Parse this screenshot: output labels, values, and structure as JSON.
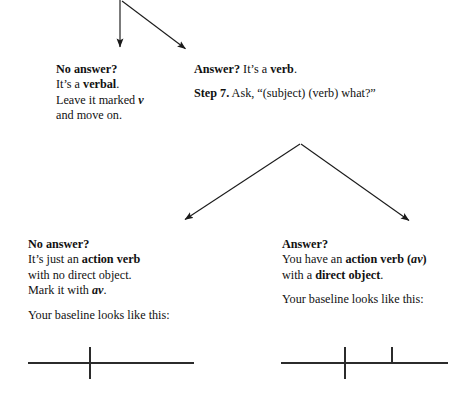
{
  "diagram": {
    "stroke_color": "#1a1a1a",
    "text_color": "#111111",
    "background": "#ffffff",
    "arrows": [
      {
        "name": "arrow-down-to-no-answer-verbal",
        "from": [
          120,
          0
        ],
        "to": [
          120,
          52
        ]
      },
      {
        "name": "arrow-diagonal-to-answer-verb",
        "from": [
          122,
          2
        ],
        "to": [
          190,
          53
        ]
      },
      {
        "name": "arrow-down-left-to-no-answer-av",
        "from": [
          300,
          144
        ],
        "to": [
          181,
          223
        ]
      },
      {
        "name": "arrow-down-right-to-answer-do",
        "from": [
          301,
          144
        ],
        "to": [
          413,
          224
        ]
      }
    ]
  },
  "blocks": {
    "no_answer_verbal": {
      "heading": "No answer?",
      "line1_prefix": "It’s a ",
      "line1_bold": "verbal",
      "line1_suffix": ".",
      "line2_prefix": "Leave it marked ",
      "line2_italic": "v",
      "line3": "and move on."
    },
    "answer_verb": {
      "heading": "Answer?",
      "line1_prefix": " It’s a ",
      "line1_bold": "verb",
      "line1_suffix": ".",
      "step_label": "Step 7.",
      "step_text": " Ask, “(subject) (verb) what?”"
    },
    "no_answer_av": {
      "heading": "No answer?",
      "line1_prefix": "It’s just an ",
      "line1_bold": "action verb",
      "line2": "with no direct object.",
      "line3_prefix": "Mark it with ",
      "line3_bolditalic": "av",
      "line3_suffix": ".",
      "baseline_caption": "Your baseline looks like this:"
    },
    "answer_do": {
      "heading": "Answer?",
      "line1_prefix": "You have an ",
      "line1_bold": "action verb (",
      "line1_bolditalic": "av",
      "line1_bold2": ")",
      "line2_prefix": "with a ",
      "line2_bold": "direct object",
      "line2_suffix": ".",
      "baseline_caption": "Your baseline looks like this:"
    }
  },
  "baselines": {
    "left": {
      "name": "baseline-action-verb-no-object",
      "horizontal": {
        "x1": 0,
        "x2": 166,
        "y": 18
      },
      "verticals": [
        {
          "name": "subject-verb-divider",
          "x": 62,
          "y1": 2,
          "y2": 34,
          "crosses": true
        }
      ]
    },
    "right": {
      "name": "baseline-action-verb-with-object",
      "horizontal": {
        "x1": 0,
        "x2": 167,
        "y": 18
      },
      "verticals": [
        {
          "name": "subject-verb-divider",
          "x": 64,
          "y1": 2,
          "y2": 34,
          "crosses": true
        },
        {
          "name": "verb-object-divider",
          "x": 111,
          "y1": 2,
          "y2": 18,
          "crosses": false
        }
      ]
    }
  }
}
